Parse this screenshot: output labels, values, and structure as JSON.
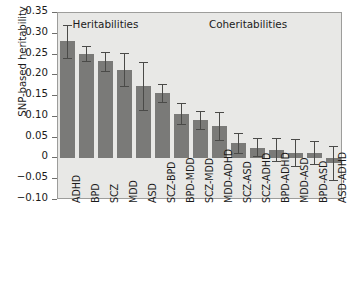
{
  "chart_data": {
    "type": "bar",
    "title": "",
    "xlabel": "",
    "ylabel": "SNP-based heritability",
    "ylim": [
      -0.1,
      0.35
    ],
    "yticks": [
      0.35,
      0.3,
      0.25,
      0.2,
      0.15,
      0.1,
      0.05,
      0,
      -0.05,
      -0.1
    ],
    "ytick_labels": [
      "0.35",
      "0.30",
      "0.25",
      "0.20",
      "0.15",
      "0.10",
      "0.05",
      "0",
      "−0.05",
      "−0.10"
    ],
    "grid": false,
    "legend": "none",
    "group_headers": [
      {
        "label": "Heritabilities",
        "spans": [
          "ADHD",
          "BPD",
          "SCZ",
          "MDD",
          "ASD"
        ]
      },
      {
        "label": "Coheritabilities",
        "spans": [
          "SCZ-BPD",
          "BPD-MDD",
          "SCZ-MDD",
          "MDD-ADHD",
          "SCZ-ASD",
          "SCZ-ADHD",
          "BPD-ADHD",
          "MDD-ASD",
          "BPD-ASD",
          "ASD-ADHD"
        ]
      }
    ],
    "categories": [
      "ADHD",
      "BPD",
      "SCZ",
      "MDD",
      "ASD",
      "SCZ-BPD",
      "BPD-MDD",
      "SCZ-MDD",
      "MDD-ADHD",
      "SCZ-ASD",
      "SCZ-ADHD",
      "BPD-ADHD",
      "MDD-ASD",
      "BPD-ASD",
      "ASD-ADHD"
    ],
    "values": [
      0.283,
      0.252,
      0.234,
      0.214,
      0.175,
      0.157,
      0.108,
      0.093,
      0.078,
      0.037,
      0.026,
      0.021,
      0.013,
      0.013,
      -0.011
    ],
    "error_low": [
      0.242,
      0.235,
      0.211,
      0.174,
      0.117,
      0.137,
      0.082,
      0.071,
      0.044,
      0.014,
      0.005,
      -0.006,
      -0.017,
      -0.014,
      -0.053
    ],
    "error_high": [
      0.322,
      0.27,
      0.256,
      0.253,
      0.233,
      0.179,
      0.133,
      0.115,
      0.112,
      0.061,
      0.048,
      0.048,
      0.046,
      0.042,
      0.031
    ],
    "bar_color": "#7a7a78",
    "error_color": "#4a4a48",
    "plot_background": "#e8e8e6",
    "figure_background": "#ffffff"
  }
}
